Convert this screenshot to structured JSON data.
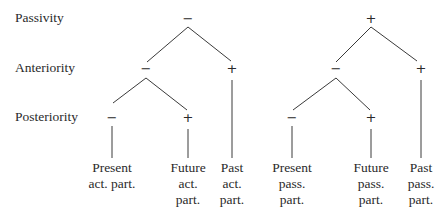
{
  "row_labels": {
    "passivity": "Passivity",
    "anteriority": "Anteriority",
    "posteriority": "Posteriority"
  },
  "left_tree": {
    "root": "−",
    "anteriority_left": "−",
    "anteriority_right": "+",
    "posteriority_left": "−",
    "posteriority_right": "+",
    "leaves": [
      {
        "line1": "Present",
        "line2": "act. part.",
        "line3": ""
      },
      {
        "line1": "Future",
        "line2": "act.",
        "line3": "part."
      },
      {
        "line1": "Past",
        "line2": "act.",
        "line3": "part."
      }
    ]
  },
  "right_tree": {
    "root": "+",
    "anteriority_left": "−",
    "anteriority_right": "+",
    "posteriority_left": "−",
    "posteriority_right": "+",
    "leaves": [
      {
        "line1": "Present",
        "line2": "pass.",
        "line3": "part."
      },
      {
        "line1": "Future",
        "line2": "pass.",
        "line3": "part."
      },
      {
        "line1": "Past",
        "line2": "pass.",
        "line3": "part."
      }
    ]
  }
}
